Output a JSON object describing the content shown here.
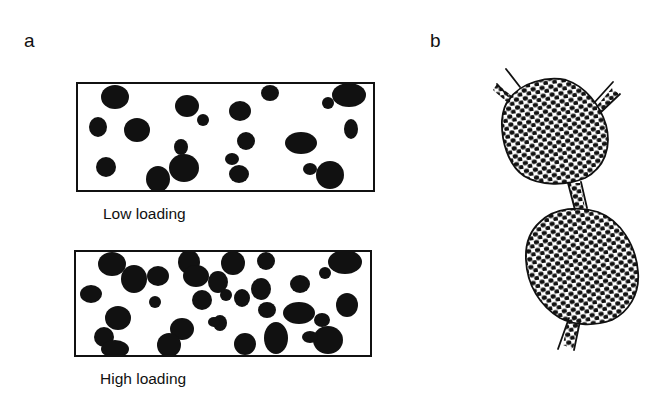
{
  "figure": {
    "panels": [
      {
        "label": "a",
        "subpanels": [
          {
            "caption": "Low loading",
            "box": [
              77,
              83,
              374,
              191
            ],
            "particles": [
              [
                115,
                97,
                14,
                12
              ],
              [
                98,
                127,
                9,
                10
              ],
              [
                137,
                130,
                13,
                12
              ],
              [
                106,
                167,
                10,
                10
              ],
              [
                187,
                106,
                12,
                11
              ],
              [
                203,
                120,
                6,
                6
              ],
              [
                181,
                147,
                7,
                8
              ],
              [
                184,
                168,
                15,
                14
              ],
              [
                158,
                179,
                12,
                13
              ],
              [
                240,
                111,
                11,
                10
              ],
              [
                246,
                141,
                9,
                9
              ],
              [
                232,
                159,
                7,
                6
              ],
              [
                239,
                174,
                10,
                9
              ],
              [
                270,
                93,
                9,
                8
              ],
              [
                301,
                143,
                16,
                11
              ],
              [
                310,
                169,
                7,
                6
              ],
              [
                330,
                175,
                14,
                14
              ],
              [
                328,
                103,
                6,
                6
              ],
              [
                349,
                95,
                17,
                12
              ],
              [
                351,
                129,
                7,
                10
              ]
            ]
          },
          {
            "caption": "High loading",
            "box": [
              75,
              251,
              371,
              356
            ],
            "particles": [
              [
                112,
                264,
                14,
                12
              ],
              [
                134,
                279,
                13,
                14
              ],
              [
                158,
                276,
                11,
                10
              ],
              [
                91,
                294,
                11,
                9
              ],
              [
                155,
                302,
                6,
                6
              ],
              [
                118,
                318,
                13,
                12
              ],
              [
                104,
                337,
                10,
                10
              ],
              [
                115,
                349,
                14,
                9
              ],
              [
                189,
                262,
                11,
                12
              ],
              [
                182,
                329,
                12,
                11
              ],
              [
                169,
                345,
                12,
                12
              ],
              [
                202,
                300,
                10,
                10
              ],
              [
                226,
                295,
                6,
                6
              ],
              [
                220,
                323,
                7,
                8
              ],
              [
                214,
                322,
                6,
                5
              ],
              [
                233,
                263,
                12,
                12
              ],
              [
                218,
                282,
                10,
                11
              ],
              [
                242,
                298,
                8,
                9
              ],
              [
                245,
                344,
                11,
                11
              ],
              [
                266,
                261,
                9,
                9
              ],
              [
                261,
                289,
                10,
                11
              ],
              [
                267,
                310,
                9,
                8
              ],
              [
                276,
                338,
                12,
                16
              ],
              [
                300,
                284,
                10,
                9
              ],
              [
                299,
                313,
                16,
                11
              ],
              [
                322,
                320,
                8,
                7
              ],
              [
                328,
                340,
                15,
                14
              ],
              [
                345,
                262,
                17,
                12
              ],
              [
                325,
                273,
                6,
                6
              ],
              [
                347,
                305,
                11,
                12
              ],
              [
                310,
                337,
                8,
                6
              ],
              [
                196,
                276,
                13,
                11
              ]
            ]
          }
        ]
      },
      {
        "label": "b",
        "description": "Two dot-filled globules connected by a filled strand, with filled strands branching from top-left, top-right and bottom."
      }
    ],
    "colors": {
      "ink": "#111111",
      "background": "#ffffff"
    }
  }
}
